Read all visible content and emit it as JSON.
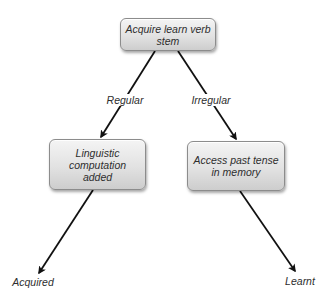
{
  "diagram": {
    "type": "decision-tree",
    "colors": {
      "node_fill_top": "#f4f4f4",
      "node_fill_bottom": "#cdcdcd",
      "node_border": "#8c8c8c",
      "text": "#2e2e2e",
      "arrow": "#111111",
      "background": "#ffffff"
    },
    "nodes": {
      "root": {
        "text": "Acquire learn verb stem"
      },
      "left": {
        "text": "Linguistic computation added"
      },
      "right": {
        "text": "Access past tense in memory"
      }
    },
    "edges": {
      "regular": {
        "label": "Regular",
        "from": "root",
        "to": "left"
      },
      "irregular": {
        "label": "Irregular",
        "from": "root",
        "to": "right"
      },
      "to_acquired": {
        "from": "left",
        "to": "acquired"
      },
      "to_learnt": {
        "from": "right",
        "to": "learnt"
      }
    },
    "leaves": {
      "acquired": {
        "text": "Acquired"
      },
      "learnt": {
        "text": "Learnt"
      }
    }
  }
}
